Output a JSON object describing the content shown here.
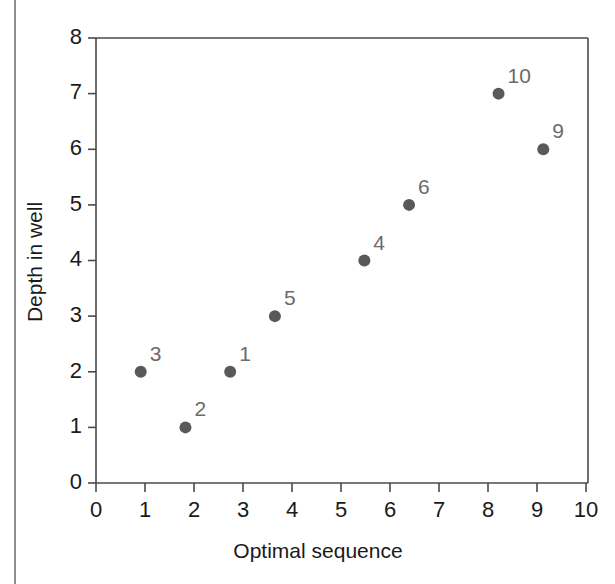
{
  "figure": {
    "kind": "scatter-plot-figure"
  },
  "chart_data": {
    "type": "scatter",
    "title": "",
    "subtitle": "",
    "xlabel": "Optimal sequence",
    "ylabel": "Depth in well",
    "xlim": [
      0,
      11
    ],
    "ylim": [
      0,
      8
    ],
    "xticks": [
      0,
      1,
      2,
      3,
      4,
      5,
      6,
      7,
      8,
      9,
      10
    ],
    "xtick_labels": [
      "0",
      "1",
      "2",
      "3",
      "4",
      "5",
      "6",
      "7",
      "8",
      "9",
      "10"
    ],
    "yticks": [
      0,
      1,
      2,
      3,
      4,
      5,
      6,
      7,
      8
    ],
    "ytick_labels": [
      "0",
      "1",
      "2",
      "3",
      "4",
      "5",
      "6",
      "7",
      "8"
    ],
    "grid": false,
    "legend": null,
    "legend_position": "none",
    "marker": "filled-circle",
    "marker_color": "#595959",
    "label_color": "#6b6b6b",
    "point_label_position": "upper-right",
    "points": [
      {
        "label": "3",
        "x": 1,
        "y": 2
      },
      {
        "label": "2",
        "x": 2,
        "y": 1
      },
      {
        "label": "1",
        "x": 3,
        "y": 2
      },
      {
        "label": "5",
        "x": 4,
        "y": 3
      },
      {
        "label": "4",
        "x": 6,
        "y": 4
      },
      {
        "label": "6",
        "x": 7,
        "y": 5
      },
      {
        "label": "10",
        "x": 9,
        "y": 7
      },
      {
        "label": "9",
        "x": 10,
        "y": 6
      }
    ]
  },
  "colors": {
    "marker": "#595959",
    "point_label": "#6b6b6b",
    "axis": "#4a4a4a",
    "text": "#1a1a1a",
    "page_rule": "#8d8d8d",
    "background": "#ffffff"
  }
}
